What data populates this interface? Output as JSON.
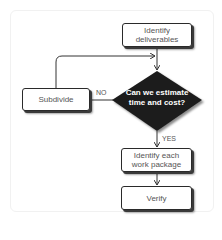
{
  "diagram": {
    "type": "flowchart",
    "nodes": [
      {
        "id": "identify_deliverables",
        "shape": "rounded-rect",
        "label": "Identify deliverables",
        "line1": "Identify",
        "line2": "deliverables"
      },
      {
        "id": "decision",
        "shape": "diamond",
        "label": "Can we estimate time and cost?",
        "line1": "Can we estimate",
        "line2": "time and cost?",
        "fill": "#1e1e1e"
      },
      {
        "id": "subdivide",
        "shape": "rounded-rect",
        "label": "Subdivide"
      },
      {
        "id": "identify_work_package",
        "shape": "rounded-rect",
        "label": "Identify each work package",
        "line1": "Identify each",
        "line2": "work package"
      },
      {
        "id": "verify",
        "shape": "rounded-rect",
        "label": "Verify"
      }
    ],
    "edges": [
      {
        "from": "identify_deliverables",
        "to": "decision",
        "label": ""
      },
      {
        "from": "decision",
        "to": "subdivide",
        "label": "NO"
      },
      {
        "from": "subdivide",
        "to": "decision",
        "label": ""
      },
      {
        "from": "decision",
        "to": "identify_work_package",
        "label": "YES"
      },
      {
        "from": "identify_work_package",
        "to": "verify",
        "label": ""
      }
    ],
    "labels": {
      "no": "NO",
      "yes": "YES"
    }
  }
}
